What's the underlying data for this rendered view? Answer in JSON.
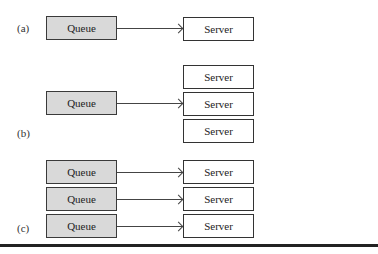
{
  "diagram": {
    "panels": [
      {
        "id": "a",
        "label": "(a)",
        "queues": [
          "Queue"
        ],
        "servers": [
          "Server"
        ],
        "description": "Single queue, single server"
      },
      {
        "id": "b",
        "label": "(b)",
        "queues": [
          "Queue"
        ],
        "servers": [
          "Server",
          "Server",
          "Server"
        ],
        "description": "Single queue, multiple servers"
      },
      {
        "id": "c",
        "label": "(c)",
        "queues": [
          "Queue",
          "Queue",
          "Queue"
        ],
        "servers": [
          "Server",
          "Server",
          "Server"
        ],
        "description": "Multiple queues, each with its own server"
      }
    ],
    "colors": {
      "queue_fill": "#d9d9d9",
      "server_fill": "#ffffff",
      "stroke": "#333333"
    }
  }
}
